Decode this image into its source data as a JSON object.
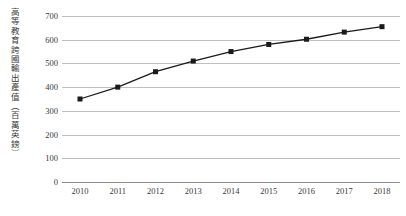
{
  "chart_data": {
    "type": "line",
    "title": "",
    "subtitle": "",
    "xlabel": "",
    "ylabel": "高等教育跨國輸出產值（百萬英鎊）",
    "categories": [
      "2010",
      "2011",
      "2012",
      "2013",
      "2014",
      "2015",
      "2016",
      "2017",
      "2018"
    ],
    "x": [
      2010,
      2011,
      2012,
      2013,
      2014,
      2015,
      2016,
      2017,
      2018
    ],
    "values": [
      350,
      400,
      465,
      510,
      550,
      580,
      602,
      632,
      655
    ],
    "series": [
      {
        "name": "高等教育跨國輸出產值",
        "values": [
          350,
          400,
          465,
          510,
          550,
          580,
          602,
          632,
          655
        ]
      }
    ],
    "ylim": [
      0,
      700
    ],
    "ytick_labels": [
      "0",
      "100",
      "200",
      "300",
      "400",
      "500",
      "600",
      "700"
    ],
    "ytick_values": [
      0,
      100,
      200,
      300,
      400,
      500,
      600,
      700
    ],
    "grid": true,
    "legend": false,
    "legend_position": "none",
    "marker": "square",
    "marker_color": "#1a1a1a",
    "line_color": "#1a1a1a",
    "gridline_color": "#bfbfbf",
    "axis_color": "#8c8c8c",
    "background_color": "#ffffff"
  }
}
